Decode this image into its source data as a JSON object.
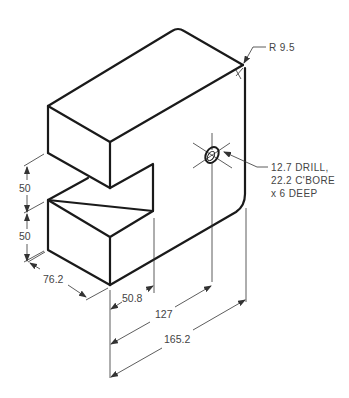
{
  "drawing": {
    "type": "isometric technical drawing",
    "dimensions": {
      "radius": "R 9.5",
      "height_upper": "50",
      "height_lower": "50",
      "depth": "76.2",
      "slot_depth": "50.8",
      "hole_location": "127",
      "overall_length": "165.2"
    },
    "hole_note": {
      "line1": "12.7 DRILL,",
      "line2": "22.2 C'BORE",
      "line3": "x 6 DEEP"
    },
    "colors": {
      "object_line": "#1a1a1a",
      "dimension_line": "#333333",
      "text": "#444444"
    }
  }
}
